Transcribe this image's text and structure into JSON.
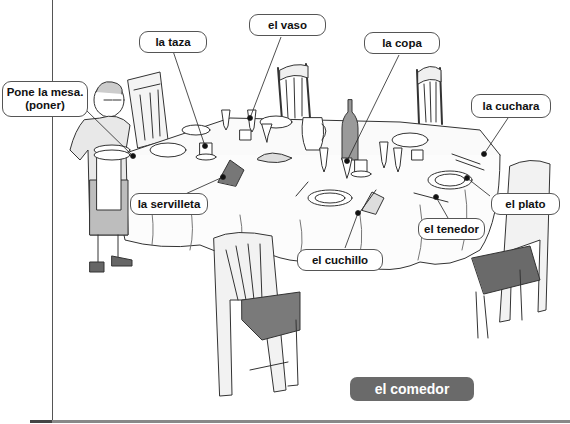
{
  "page": {
    "title": "el comedor",
    "title_badge_color": "#6a6a6a"
  },
  "labels": {
    "pone_la_mesa": {
      "line1": "Pone la mesa.",
      "line2": "(poner)"
    },
    "la_taza": "la taza",
    "el_vaso": "el vaso",
    "la_copa": "la copa",
    "la_cuchara": "la cuchara",
    "la_servilleta": "la servilleta",
    "el_plato": "el plato",
    "el_tenedor": "el tenedor",
    "el_cuchillo": "el cuchillo"
  },
  "illustration": {
    "subject": "woman setting a dining table with chairs, plates, glasses, cups and cutlery"
  }
}
